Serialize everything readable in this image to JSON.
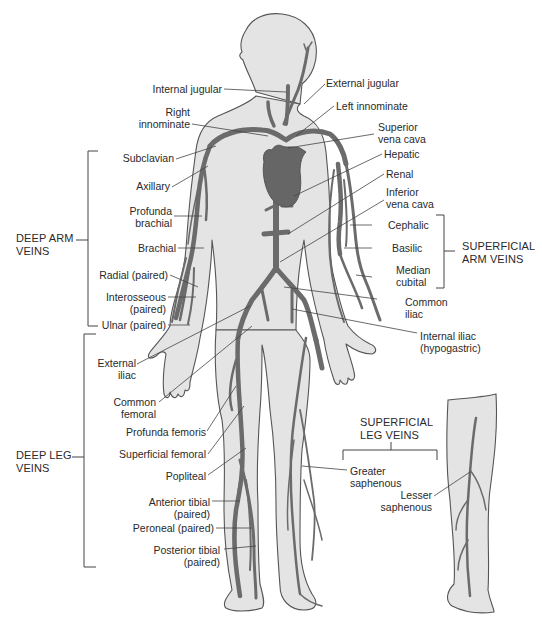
{
  "figure": {
    "colors": {
      "skin_fill": "#e4e4e4",
      "skin_outline": "#555555",
      "vein": "#6b6b6b",
      "heart": "#666666",
      "text": "#2a2a2a",
      "leader_line": "#444444",
      "background": "#ffffff"
    }
  },
  "groups": {
    "deep_arm": "DEEP ARM\nVEINS",
    "superficial_arm": "SUPERFICIAL\nARM VEINS",
    "deep_leg": "DEEP LEG\nVEINS",
    "superficial_leg": "SUPERFICIAL\nLEG VEINS"
  },
  "labels": {
    "internal_jugular": "Internal jugular",
    "external_jugular": "External jugular",
    "right_innominate": "Right\ninnominate",
    "left_innominate": "Left innominate",
    "superior_vena_cava": "Superior\nvena cava",
    "subclavian": "Subclavian",
    "hepatic": "Hepatic",
    "axillary": "Axillary",
    "renal": "Renal",
    "inferior_vena_cava": "Inferior\nvena cava",
    "profunda_brachial": "Profunda\nbrachial",
    "cephalic": "Cephalic",
    "brachial": "Brachial",
    "basilic": "Basilic",
    "radial": "Radial (paired)",
    "median_cubital": "Median\ncubital",
    "interosseous": "Interosseous\n(paired)",
    "common_iliac": "Common\niliac",
    "ulnar": "Ulnar (paired)",
    "internal_iliac": "Internal iliac\n(hypogastric)",
    "external_iliac": "External\niliac",
    "common_femoral": "Common\nfemoral",
    "profunda_femoris": "Profunda femoris",
    "superficial_femoral": "Superficial femoral",
    "popliteal": "Popliteal",
    "greater_saphenous": "Greater\nsaphenous",
    "lesser_saphenous": "Lesser\nsaphenous",
    "anterior_tibial": "Anterior tibial\n(paired)",
    "peroneal": "Peroneal (paired)",
    "posterior_tibial": "Posterior tibial\n(paired)"
  }
}
